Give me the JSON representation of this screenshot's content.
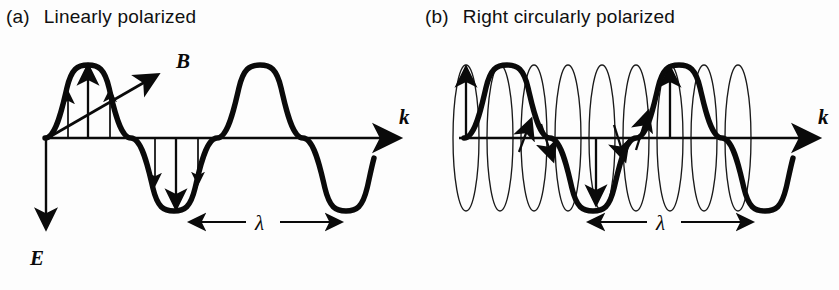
{
  "figure": {
    "background_color": "#fdfdfd",
    "ink_color": "#0a0a0a",
    "width": 839,
    "height": 290
  },
  "panels": [
    {
      "id": "a",
      "tag": "(a)",
      "title": "Linearly polarized",
      "axis_label": "k",
      "wavelength_label": "λ",
      "field_labels": [
        "B",
        "E"
      ],
      "wave": {
        "type": "sine",
        "cycles": 2.2,
        "amplitude_px": 73,
        "axis_y_px": 138,
        "start_x_px": 45,
        "wavelength_px": 172
      },
      "field_vectors": {
        "description": "vertical E-field arrows sampled along first half cycle (up) and second half cycle (down)",
        "up_arrow_x": [
          68,
          88,
          110
        ],
        "down_arrow_x": [
          155,
          176,
          198
        ]
      },
      "b_vector": {
        "from": [
          46,
          138
        ],
        "to": [
          163,
          71
        ],
        "label_at": [
          178,
          64
        ]
      },
      "e_vector": {
        "from": [
          46,
          140
        ],
        "to": [
          46,
          236
        ],
        "label_at": [
          36,
          262
        ]
      },
      "wavelength_span": {
        "x1": 178,
        "x2": 350,
        "y": 222
      }
    },
    {
      "id": "b",
      "tag": "(b)",
      "title": "Right circularly polarized",
      "axis_label": "k",
      "wavelength_label": "λ",
      "field_labels": [],
      "wave": {
        "type": "sine",
        "cycles": 2.2,
        "amplitude_px": 73,
        "axis_y_px": 138,
        "start_x_px": 45,
        "wavelength_px": 172
      },
      "ellipses": {
        "count": 9,
        "description": "narrow vertical ellipses showing the rotating E vector traced at successive phases",
        "rx_px": 13,
        "ry_px": 73,
        "center_x_px": [
          66,
          100,
          134,
          168,
          202,
          236,
          270,
          304,
          338
        ],
        "center_y_px": 138
      },
      "rotating_vectors": {
        "description": "bold arrows on the wave showing E direction at sampled phases",
        "x_positions": [
          66,
          134,
          202,
          270
        ]
      },
      "wavelength_span": {
        "x1": 583,
        "x2": 760,
        "y": 222
      }
    }
  ]
}
